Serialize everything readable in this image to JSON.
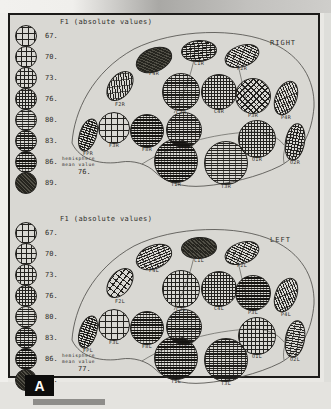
{
  "figure": {
    "panel_letter": "A",
    "colors": {
      "ink": "#23221f",
      "paper": "#d9d8d3",
      "frame": "#1c1b19",
      "badge_bg": "#0d0d0c",
      "badge_fg": "#fdfdfb"
    }
  },
  "legend": {
    "items": [
      {
        "value": "67.",
        "pat": "g1"
      },
      {
        "value": "70.",
        "pat": "g2"
      },
      {
        "value": "73.",
        "pat": "g3"
      },
      {
        "value": "76.",
        "pat": "g4"
      },
      {
        "value": "80.",
        "pat": "h5"
      },
      {
        "value": "83.",
        "pat": "h6"
      },
      {
        "value": "86.",
        "pat": "h7"
      },
      {
        "value": "89.",
        "pat": "s8"
      }
    ]
  },
  "right_panel": {
    "title": "F1 (absolute values)",
    "side_label": "RIGHT",
    "mean_caption_line1": "hemisphere",
    "mean_caption_line2": "mean value",
    "mean_value": "76.",
    "regions": [
      {
        "label": "FPR",
        "pat": "h6"
      },
      {
        "label": "F3R",
        "pat": "g1"
      },
      {
        "label": "F8R",
        "pat": "h7"
      },
      {
        "label": "F2R",
        "pat": "d5"
      },
      {
        "label": "F4R",
        "pat": "s8"
      },
      {
        "label": "C1R",
        "pat": "h6"
      },
      {
        "label": "P2R",
        "pat": "d5"
      },
      {
        "label": "C2R",
        "pat": "h6"
      },
      {
        "label": "C4R",
        "pat": "g4"
      },
      {
        "label": "P3R",
        "pat": "d3"
      },
      {
        "label": "P4R",
        "pat": "d5"
      },
      {
        "label": "T2R",
        "pat": "h6"
      },
      {
        "label": "O1R",
        "pat": "g4"
      },
      {
        "label": "O2R",
        "pat": "g4"
      },
      {
        "label": "T1R",
        "pat": "h7"
      },
      {
        "label": "T3R",
        "pat": "h5"
      }
    ]
  },
  "left_panel": {
    "title": "F1 (absolute values)",
    "side_label": "LEFT",
    "mean_caption_line1": "hemisphere",
    "mean_caption_line2": "mean value",
    "mean_value": "77.",
    "regions": [
      {
        "label": "FPL",
        "pat": "h6"
      },
      {
        "label": "F3L",
        "pat": "g1"
      },
      {
        "label": "F8L",
        "pat": "h7"
      },
      {
        "label": "F2L",
        "pat": "g2"
      },
      {
        "label": "F4L",
        "pat": "h5"
      },
      {
        "label": "C1L",
        "pat": "s8"
      },
      {
        "label": "P2L",
        "pat": "d5"
      },
      {
        "label": "C2L",
        "pat": "g3"
      },
      {
        "label": "C4L",
        "pat": "g4"
      },
      {
        "label": "P3L",
        "pat": "h7"
      },
      {
        "label": "P4L",
        "pat": "d5"
      },
      {
        "label": "T2L",
        "pat": "h6"
      },
      {
        "label": "O1L",
        "pat": "g3"
      },
      {
        "label": "O2L",
        "pat": "h5"
      },
      {
        "label": "T1L",
        "pat": "h7"
      },
      {
        "label": "T3L",
        "pat": "h6"
      }
    ]
  }
}
